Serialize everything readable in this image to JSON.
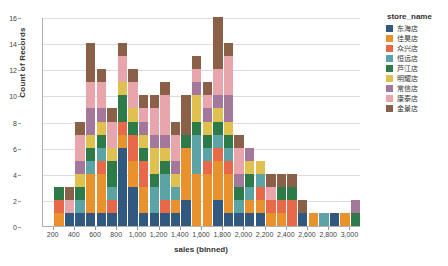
{
  "chart_data": {
    "type": "bar",
    "title": "",
    "subtitle": "",
    "xlabel": "sales (binned)",
    "ylabel": "Count of Records",
    "stacked": true,
    "grid": true,
    "legend_position": "right",
    "legend_title": "store_name",
    "xlim": [
      100,
      3100
    ],
    "ylim": [
      0,
      16
    ],
    "ytick_labels": [
      "0",
      "2",
      "4",
      "6",
      "8",
      "10",
      "12",
      "14",
      "16"
    ],
    "ytick_values": [
      0,
      2,
      4,
      6,
      8,
      10,
      12,
      14,
      16
    ],
    "xtick_labels": [
      "200",
      "400",
      "600",
      "800",
      "1,000",
      "1,200",
      "1,400",
      "1,600",
      "1,800",
      "2,000",
      "2,200",
      "2,400",
      "2,600",
      "2,800",
      "3,000"
    ],
    "xtick_values": [
      200,
      400,
      600,
      800,
      1000,
      1200,
      1400,
      1600,
      1800,
      2000,
      2200,
      2400,
      2600,
      2800,
      3000
    ],
    "bin_width": 100,
    "categories": [
      200,
      300,
      400,
      500,
      600,
      700,
      800,
      900,
      1000,
      1100,
      1200,
      1300,
      1400,
      1500,
      1600,
      1700,
      1800,
      1900,
      2000,
      2100,
      2200,
      2300,
      2400,
      2500,
      2600,
      2700,
      2800,
      2900,
      3000
    ],
    "totals": [
      2,
      3,
      7,
      13,
      14,
      9,
      14,
      12,
      10,
      10,
      11,
      9,
      14,
      10,
      13,
      15,
      13,
      7,
      6,
      5,
      4,
      4,
      4,
      2,
      1,
      1,
      1,
      1,
      1
    ],
    "series": [
      {
        "name": "东海店",
        "color": "#31587f",
        "values": [
          0,
          1,
          1,
          1,
          1,
          1,
          6,
          3,
          1,
          1,
          1,
          1,
          2,
          0,
          0,
          2,
          1,
          1,
          1,
          1,
          0,
          0,
          0,
          1,
          0,
          0,
          1,
          0,
          0
        ]
      },
      {
        "name": "佳昊店",
        "color": "#e8912d",
        "values": [
          1,
          0,
          0,
          3,
          3,
          0,
          1,
          2,
          2,
          0,
          0,
          1,
          4,
          4,
          4,
          3,
          3,
          0,
          1,
          1,
          1,
          1,
          0,
          0,
          1,
          0,
          0,
          1,
          0
        ]
      },
      {
        "name": "众兴店",
        "color": "#e8684a",
        "values": [
          1,
          0,
          0,
          0,
          1,
          1,
          1,
          2,
          2,
          0,
          1,
          0,
          0,
          0,
          1,
          1,
          1,
          0,
          0,
          1,
          1,
          1,
          2,
          0,
          0,
          0,
          0,
          0,
          0
        ]
      },
      {
        "name": "恒远店",
        "color": "#5ba3a5",
        "values": [
          0,
          0,
          1,
          1,
          1,
          1,
          0,
          0,
          0,
          2,
          2,
          1,
          0,
          3,
          1,
          1,
          1,
          1,
          1,
          1,
          0,
          0,
          0,
          0,
          0,
          1,
          0,
          0,
          0
        ]
      },
      {
        "name": "芦江店",
        "color": "#2c7b49",
        "values": [
          1,
          0,
          1,
          1,
          1,
          2,
          2,
          1,
          1,
          1,
          1,
          0,
          1,
          1,
          1,
          1,
          1,
          1,
          1,
          0,
          0,
          1,
          1,
          0,
          0,
          0,
          0,
          0,
          1
        ]
      },
      {
        "name": "明耀店",
        "color": "#e0c04f",
        "values": [
          0,
          0,
          1,
          1,
          1,
          1,
          1,
          1,
          1,
          2,
          1,
          1,
          0,
          2,
          1,
          1,
          1,
          0,
          1,
          1,
          0,
          0,
          0,
          0,
          0,
          0,
          0,
          0,
          0
        ]
      },
      {
        "name": "常信店",
        "color": "#a3789b",
        "values": [
          0,
          0,
          1,
          2,
          1,
          0,
          0,
          0,
          1,
          1,
          1,
          1,
          0,
          1,
          1,
          1,
          2,
          1,
          1,
          0,
          0,
          0,
          0,
          0,
          0,
          0,
          0,
          0,
          1
        ]
      },
      {
        "name": "康泰店",
        "color": "#e8a6ac",
        "values": [
          0,
          1,
          2,
          2,
          2,
          2,
          2,
          2,
          1,
          2,
          3,
          2,
          0,
          1,
          1,
          2,
          3,
          2,
          0,
          0,
          1,
          0,
          0,
          0,
          0,
          0,
          0,
          0,
          0
        ]
      },
      {
        "name": "金景店",
        "color": "#8a6048",
        "values": [
          0,
          1,
          1,
          3,
          1,
          1,
          1,
          1,
          1,
          1,
          1,
          1,
          3,
          1,
          1,
          4,
          1,
          1,
          0,
          0,
          1,
          1,
          1,
          1,
          0,
          0,
          0,
          0,
          0
        ]
      }
    ]
  },
  "legend": {
    "title": "store_name",
    "items": [
      {
        "label": "东海店",
        "color": "#31587f"
      },
      {
        "label": "佳昊店",
        "color": "#e8912d"
      },
      {
        "label": "众兴店",
        "color": "#e8684a"
      },
      {
        "label": "恒远店",
        "color": "#5ba3a5"
      },
      {
        "label": "芦江店",
        "color": "#2c7b49"
      },
      {
        "label": "明耀店",
        "color": "#e0c04f"
      },
      {
        "label": "常信店",
        "color": "#a3789b"
      },
      {
        "label": "康泰店",
        "color": "#e8a6ac"
      },
      {
        "label": "金景店",
        "color": "#8a6048"
      }
    ]
  }
}
